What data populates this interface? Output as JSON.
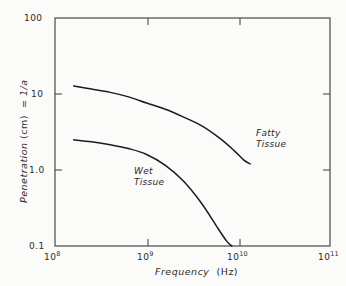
{
  "chart_data": {
    "type": "line",
    "title": "",
    "xlabel": "Frequency (Hz)",
    "ylabel": "Penetration (cm)  =  1/a",
    "xscale": "log",
    "yscale": "log",
    "xlim": [
      100000000,
      100000000000
    ],
    "ylim": [
      0.1,
      100
    ],
    "grid": false,
    "legend_position": "inline-annotations",
    "xtick_labels": [
      "10",
      "10",
      "10",
      "10"
    ],
    "xtick_exponents": [
      "8",
      "9",
      "10",
      "11"
    ],
    "xtick_values": [
      100000000,
      1000000000,
      10000000000,
      100000000000
    ],
    "ytick_labels": [
      "100",
      "10",
      "1.0",
      "0.1"
    ],
    "ytick_values": [
      100,
      10,
      1.0,
      0.1
    ],
    "series": [
      {
        "name": "Fatty Tissue",
        "annotation_lines": [
          "Fatty",
          "Tissue"
        ],
        "x": [
          160000000,
          250000000,
          400000000,
          650000000,
          1000000000,
          1600000000,
          2500000000,
          4000000000,
          6300000000,
          9000000000,
          11500000000.0,
          13500000000.0
        ],
        "y": [
          12.7,
          11.6,
          10.5,
          9.1,
          7.6,
          6.3,
          5.0,
          3.8,
          2.6,
          1.8,
          1.35,
          1.2
        ]
      },
      {
        "name": "Wet Tissue",
        "annotation_lines": [
          "Wet",
          "Tissue"
        ],
        "x": [
          160000000,
          250000000,
          400000000,
          650000000,
          1000000000,
          1600000000,
          2500000000,
          4000000000,
          6000000000,
          7500000000,
          8500000000
        ],
        "y": [
          2.5,
          2.35,
          2.15,
          1.9,
          1.6,
          1.15,
          0.72,
          0.36,
          0.17,
          0.115,
          0.1
        ]
      }
    ]
  },
  "axes": {
    "xlabel_text": "Frequency",
    "xlabel_unit": "(Hz)",
    "ylabel_main": "Penetration",
    "ylabel_unit": "(cm)",
    "ylabel_tail": "=  1/a"
  }
}
